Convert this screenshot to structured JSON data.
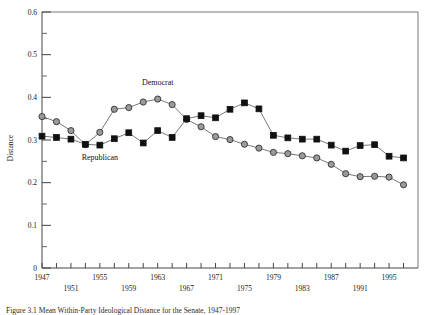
{
  "chart_data": {
    "type": "line",
    "title": "",
    "xlabel": "",
    "ylabel": "Distance",
    "ylim": [
      0,
      0.6
    ],
    "xlim": [
      1947,
      1999
    ],
    "grid": false,
    "legend_position": "inline-annotations",
    "y_ticks_major": [
      "0",
      "0.1",
      "0.2",
      "0.3",
      "0.4",
      "0.5",
      "0.6"
    ],
    "y_ticks_major_values": [
      0,
      0.1,
      0.2,
      0.3,
      0.4,
      0.5,
      0.6
    ],
    "y_ticks_minor_values": [
      0.05,
      0.15,
      0.25,
      0.35,
      0.45,
      0.55
    ],
    "x_ticks_labeled": [
      "1947",
      "1951",
      "1955",
      "1959",
      "1963",
      "1967",
      "1971",
      "1975",
      "1979",
      "1983",
      "1987",
      "1991",
      "1995"
    ],
    "x_ticks_labeled_values": [
      1947,
      1951,
      1955,
      1959,
      1963,
      1967,
      1971,
      1975,
      1979,
      1983,
      1987,
      1991,
      1995
    ],
    "x_ticks_all_values": [
      1947,
      1949,
      1951,
      1953,
      1955,
      1957,
      1959,
      1961,
      1963,
      1965,
      1967,
      1969,
      1971,
      1973,
      1975,
      1977,
      1979,
      1981,
      1983,
      1985,
      1987,
      1989,
      1991,
      1993,
      1995,
      1997
    ],
    "x": [
      1947,
      1949,
      1951,
      1953,
      1955,
      1957,
      1959,
      1961,
      1963,
      1965,
      1967,
      1969,
      1971,
      1973,
      1975,
      1977,
      1979,
      1981,
      1983,
      1985,
      1987,
      1989,
      1991,
      1993,
      1995,
      1997
    ],
    "series": [
      {
        "name": "Democrat",
        "marker": "circle",
        "color": "#9a9a9a",
        "values": [
          0.355,
          0.343,
          0.322,
          0.289,
          0.318,
          0.372,
          0.376,
          0.389,
          0.396,
          0.383,
          0.348,
          0.331,
          0.308,
          0.301,
          0.29,
          0.281,
          0.271,
          0.268,
          0.263,
          0.258,
          0.243,
          0.221,
          0.214,
          0.215,
          0.213,
          0.195
        ],
        "label_x": 1963,
        "label_y": 0.428
      },
      {
        "name": "Republican",
        "marker": "square",
        "color": "#111111",
        "values": [
          0.309,
          0.306,
          0.302,
          0.29,
          0.288,
          0.303,
          0.317,
          0.293,
          0.322,
          0.306,
          0.35,
          0.357,
          0.352,
          0.372,
          0.387,
          0.373,
          0.311,
          0.305,
          0.302,
          0.302,
          0.288,
          0.274,
          0.287,
          0.289,
          0.262,
          0.258
        ],
        "label_x": 1955,
        "label_y": 0.252
      }
    ]
  },
  "caption": {
    "text": "Figure 3.1 Mean Within-Party Ideological Distance for the Senate, 1947-1997"
  }
}
